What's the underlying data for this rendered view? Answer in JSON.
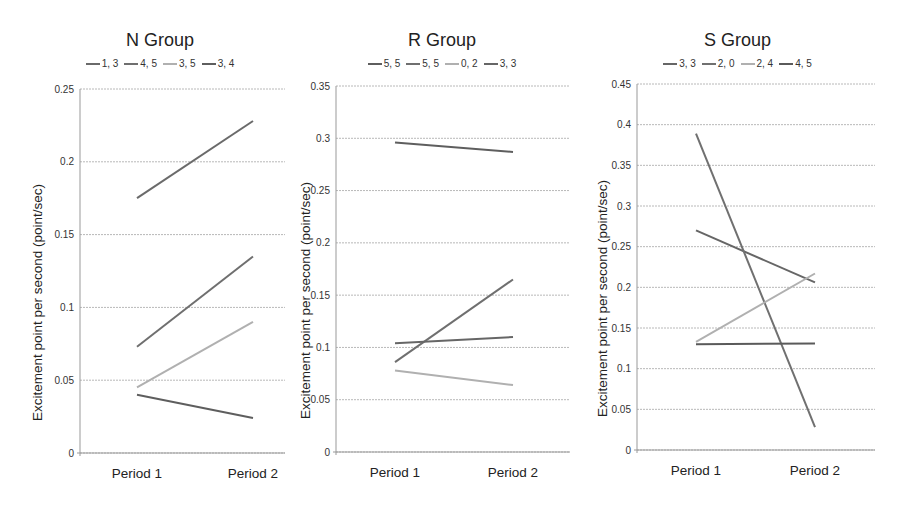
{
  "chart_data": [
    {
      "type": "line",
      "title": "N Group",
      "xlabel": "",
      "ylabel": "Excitement point per second (point/sec)",
      "categories": [
        "Period 1",
        "Period 2"
      ],
      "ylim": [
        0,
        0.25
      ],
      "yticks": [
        "0",
        "0.05",
        "0.1",
        "0.15",
        "0.2",
        "0.25"
      ],
      "grid": true,
      "legend_position": "top",
      "series": [
        {
          "name": "1, 3",
          "values": [
            0.175,
            0.228
          ],
          "color": "#6a6a6a"
        },
        {
          "name": "4, 5",
          "values": [
            0.073,
            0.135
          ],
          "color": "#6f6f6f"
        },
        {
          "name": "3, 5",
          "values": [
            0.045,
            0.09
          ],
          "color": "#b0b0b0"
        },
        {
          "name": "3, 4",
          "values": [
            0.04,
            0.024
          ],
          "color": "#5e5e5e"
        }
      ]
    },
    {
      "type": "line",
      "title": "R Group",
      "xlabel": "",
      "ylabel": "Excitement point per second (point/sec)",
      "categories": [
        "Period 1",
        "Period 2"
      ],
      "ylim": [
        0,
        0.35
      ],
      "yticks": [
        "0",
        "0.05",
        "0.1",
        "0.15",
        "0.2",
        "0.25",
        "0.3",
        "0.35"
      ],
      "grid": true,
      "legend_position": "top",
      "series": [
        {
          "name": "5, 5",
          "values": [
            0.296,
            0.287
          ],
          "color": "#5e5e5e"
        },
        {
          "name": "5, 5",
          "values": [
            0.086,
            0.165
          ],
          "color": "#6f6f6f"
        },
        {
          "name": "0, 2",
          "values": [
            0.078,
            0.064
          ],
          "color": "#b0b0b0"
        },
        {
          "name": "3, 3",
          "values": [
            0.104,
            0.11
          ],
          "color": "#666666"
        }
      ]
    },
    {
      "type": "line",
      "title": "S Group",
      "xlabel": "",
      "ylabel": "Excitement point per second (point/sec)",
      "categories": [
        "Period 1",
        "Period 2"
      ],
      "ylim": [
        0,
        0.45
      ],
      "yticks": [
        "0",
        "0.05",
        "0.1",
        "0.15",
        "0.2",
        "0.25",
        "0.3",
        "0.35",
        "0.4",
        "0.45"
      ],
      "grid": true,
      "legend_position": "top",
      "series": [
        {
          "name": "3, 3",
          "values": [
            0.27,
            0.206
          ],
          "color": "#666666"
        },
        {
          "name": "2, 0",
          "values": [
            0.389,
            0.028
          ],
          "color": "#707070"
        },
        {
          "name": "2, 4",
          "values": [
            0.133,
            0.217
          ],
          "color": "#b0b0b0"
        },
        {
          "name": "4, 5",
          "values": [
            0.13,
            0.131
          ],
          "color": "#5a5a5a"
        }
      ]
    }
  ]
}
